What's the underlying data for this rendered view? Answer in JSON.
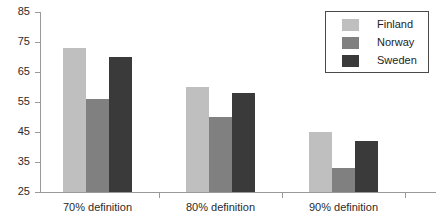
{
  "chart_data": {
    "type": "bar",
    "title": "",
    "subtitle": "",
    "xlabel": "",
    "ylabel": "",
    "categories": [
      "70% definition",
      "80% definition",
      "90% definition"
    ],
    "series": [
      {
        "name": "Finland",
        "color": "#bfbfbf",
        "values": [
          73,
          60,
          45
        ]
      },
      {
        "name": "Norway",
        "color": "#808080",
        "values": [
          56,
          50,
          33
        ]
      },
      {
        "name": "Sweden",
        "color": "#3a3a3a",
        "values": [
          70,
          58,
          42
        ]
      }
    ],
    "ylim": [
      25,
      85
    ],
    "ytick_step": 10,
    "yticks": [
      85,
      75,
      65,
      55,
      45,
      35,
      25
    ],
    "ytick_labels": [
      "85",
      "75",
      "65",
      "55",
      "45",
      "35",
      "25"
    ],
    "grid": false,
    "legend_position": "top-right",
    "legend_entries": [
      "Finland",
      "Norway",
      "Sweden"
    ],
    "axis_color": "#9a9a9a",
    "text_color": "#2b2b2b",
    "background": "#ffffff"
  }
}
